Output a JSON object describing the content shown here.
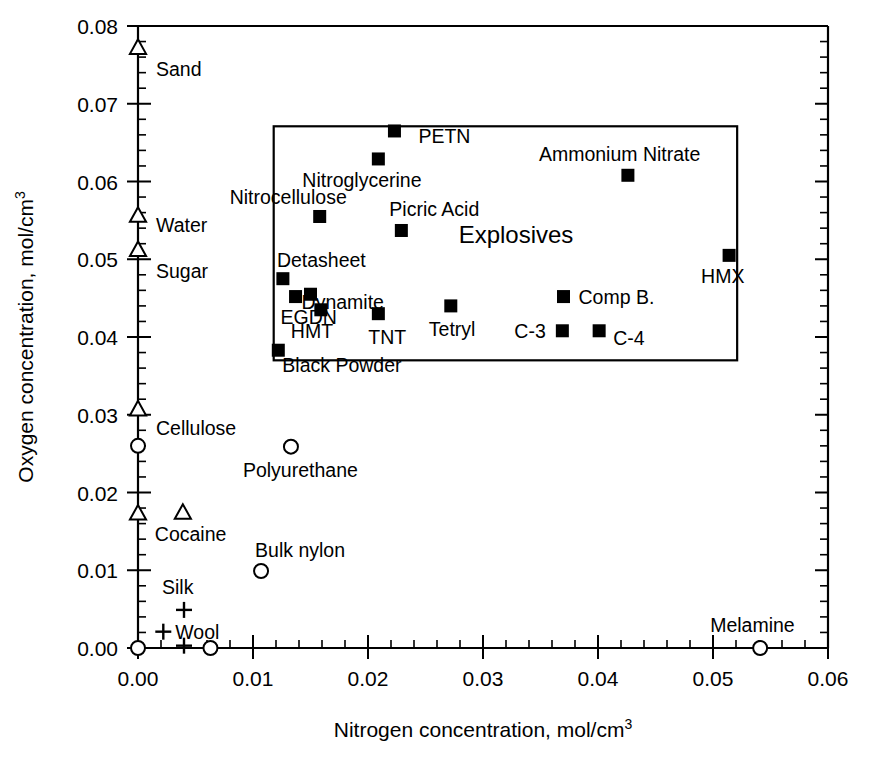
{
  "chart_data": {
    "type": "scatter",
    "title": "",
    "xlabel": "Nitrogen concentration, mol/cm3",
    "xlabel_base": "Nitrogen concentration, mol/cm",
    "xlabel_sup": "3",
    "ylabel_base": "Oxygen concentration, mol/cm",
    "ylabel_sup": "3",
    "ylabel": "Oxygen concentration, mol/cm3",
    "xlim": [
      0.0,
      0.06
    ],
    "ylim": [
      0.0,
      0.08
    ],
    "xticks": [
      "0.00",
      "0.01",
      "0.02",
      "0.03",
      "0.04",
      "0.05",
      "0.06"
    ],
    "xtick_values": [
      0.0,
      0.01,
      0.02,
      0.03,
      0.04,
      0.05,
      0.06
    ],
    "yticks": [
      "0.00",
      "0.01",
      "0.02",
      "0.03",
      "0.04",
      "0.05",
      "0.06",
      "0.07",
      "0.08"
    ],
    "ytick_values": [
      0.0,
      0.01,
      0.02,
      0.03,
      0.04,
      0.05,
      0.06,
      0.07,
      0.08
    ],
    "minor_tick_count": 5,
    "grid": false,
    "legend": "none",
    "inset_label": "Explosives",
    "inset_box": {
      "x0": 0.0118,
      "y0": 0.037,
      "x1": 0.0521,
      "y1": 0.0671
    },
    "marker_styles": {
      "square": "filled-square",
      "circle": "open-circle",
      "triangle": "open-triangle",
      "plus": "plus"
    },
    "series": [
      {
        "name": "Explosives",
        "marker": "square",
        "points": [
          {
            "label": "PETN",
            "x": 0.0223,
            "y": 0.0665,
            "lx": 24,
            "ly": 12
          },
          {
            "label": "Nitroglycerine",
            "x": 0.0209,
            "y": 0.0629,
            "lx": -76,
            "ly": 28
          },
          {
            "label": "Ammonium Nitrate",
            "x": 0.0426,
            "y": 0.0608,
            "lx": -89,
            "ly": -14
          },
          {
            "label": "Nitrocellulose",
            "x": 0.0158,
            "y": 0.0555,
            "lx": -90,
            "ly": -12
          },
          {
            "label": "Picric Acid",
            "x": 0.0229,
            "y": 0.0537,
            "lx": -12,
            "ly": -14
          },
          {
            "label": "HMX",
            "x": 0.0514,
            "y": 0.0505,
            "lx": -28,
            "ly": 28
          },
          {
            "label": "Detasheet",
            "x": 0.0126,
            "y": 0.0475,
            "lx": -6,
            "ly": -12
          },
          {
            "label": "EGDN",
            "x": 0.015,
            "y": 0.0455,
            "lx": -30,
            "ly": 30
          },
          {
            "label": "Dynamite",
            "x": 0.0137,
            "y": 0.0452,
            "lx": 6,
            "ly": 12
          },
          {
            "label": "Comp B.",
            "x": 0.037,
            "y": 0.0452,
            "lx": 15,
            "ly": 7
          },
          {
            "label": "HMT",
            "x": 0.0159,
            "y": 0.0435,
            "lx": -30,
            "ly": 28
          },
          {
            "label": "Tetryl",
            "x": 0.0272,
            "y": 0.044,
            "lx": -22,
            "ly": 30
          },
          {
            "label": "TNT",
            "x": 0.0209,
            "y": 0.043,
            "lx": -10,
            "ly": 30
          },
          {
            "label": "C-3",
            "x": 0.0369,
            "y": 0.0408,
            "lx": -48,
            "ly": 7
          },
          {
            "label": "C-4",
            "x": 0.0401,
            "y": 0.0408,
            "lx": 14,
            "ly": 14
          },
          {
            "label": "Black Powder",
            "x": 0.0122,
            "y": 0.0383,
            "lx": 4,
            "ly": 22
          }
        ]
      },
      {
        "name": "Triangles",
        "marker": "triangle",
        "points": [
          {
            "label": "Sand",
            "x": 0.0,
            "y": 0.0772,
            "lx": 18,
            "ly": 28
          },
          {
            "label": "Water",
            "x": 0.0,
            "y": 0.0556,
            "lx": 18,
            "ly": 16
          },
          {
            "label": "Sugar",
            "x": 0.0,
            "y": 0.0512,
            "lx": 18,
            "ly": 28
          },
          {
            "label": "Cellulose",
            "x": 0.0,
            "y": 0.0307,
            "lx": 18,
            "ly": 26
          },
          {
            "label": "Cocaine",
            "x": 0.0039,
            "y": 0.0174,
            "lx": -28,
            "ly": 28
          },
          {
            "label": "",
            "x": 0.0,
            "y": 0.0173,
            "lx": 0,
            "ly": 0
          }
        ]
      },
      {
        "name": "Circles",
        "marker": "circle",
        "points": [
          {
            "label": "",
            "x": 0.0,
            "y": 0.026,
            "lx": 0,
            "ly": 0
          },
          {
            "label": "Polyurethane",
            "x": 0.0133,
            "y": 0.0259,
            "lx": -48,
            "ly": 30
          },
          {
            "label": "Bulk nylon",
            "x": 0.0107,
            "y": 0.0099,
            "lx": -6,
            "ly": -14
          },
          {
            "label": "Melamine",
            "x": 0.0541,
            "y": 0.0,
            "lx": -50,
            "ly": -16
          },
          {
            "label": "",
            "x": 0.0063,
            "y": 0.0,
            "lx": 0,
            "ly": 0
          },
          {
            "label": "",
            "x": 0.0,
            "y": 0.0,
            "lx": 0,
            "ly": 0
          }
        ]
      },
      {
        "name": "Plus",
        "marker": "plus",
        "points": [
          {
            "label": "Silk",
            "x": 0.004,
            "y": 0.0049,
            "lx": -22,
            "ly": -16
          },
          {
            "label": "Wool",
            "x": 0.0022,
            "y": 0.0021,
            "lx": 12,
            "ly": 7
          },
          {
            "label": "",
            "x": 0.004,
            "y": 0.0003,
            "lx": 0,
            "ly": 0
          }
        ]
      }
    ]
  }
}
